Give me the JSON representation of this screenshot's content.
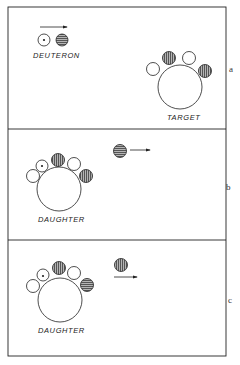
{
  "figure": {
    "panels": [
      {
        "id": "a",
        "letter": "a",
        "labels": {
          "projectile": "DEUTERON",
          "nucleus": "TARGET"
        },
        "description": "Deuteron (neutron + proton) approaches target nucleus"
      },
      {
        "id": "b",
        "letter": "b",
        "labels": {
          "nucleus": "DAUGHTER"
        },
        "description": "Neutron captured by target; horizontally hatched particle moves away"
      },
      {
        "id": "c",
        "letter": "c",
        "labels": {
          "nucleus": "DAUGHTER"
        },
        "description": "Daughter nucleus with emitted vertically hatched particle moving away"
      }
    ],
    "particle_legend": {
      "open_circle": "nucleon",
      "dotted_circle": "nucleon with center dot",
      "vertical_hatch": "hatched nucleon (vertical lines)",
      "horizontal_hatch": "hatched nucleon (horizontal lines)"
    },
    "colors": {
      "stroke": "#222222",
      "hatch_fill": "#8a8a8a",
      "background": "#ffffff"
    }
  }
}
